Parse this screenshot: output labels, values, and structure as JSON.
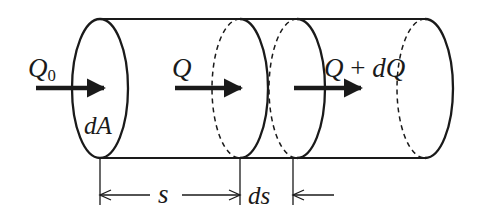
{
  "diagram": {
    "colors": {
      "stroke": "#1a1a1a",
      "background": "#ffffff"
    },
    "labels": {
      "inflow_symbol": "Q",
      "inflow_subscript": "0",
      "area_element": "dA",
      "flow_at_s": "Q",
      "flow_at_s_plus_ds_left": "Q",
      "flow_at_s_plus_ds_op": "+",
      "flow_at_s_plus_ds_right": "dQ",
      "distance": "s",
      "distance_increment": "ds"
    },
    "arrows": [
      {
        "name": "inflow-arrow",
        "label": "Q0",
        "x1": 36,
        "x2": 108,
        "y": 88
      },
      {
        "name": "flow-arrow-s",
        "label": "Q",
        "x1": 175,
        "x2": 245,
        "y": 88
      },
      {
        "name": "flow-arrow-s-plus-ds",
        "label": "Q + dQ",
        "x1": 294,
        "x2": 365,
        "y": 88
      }
    ],
    "dimensions": [
      {
        "name": "s",
        "from_x": 100,
        "to_x": 240,
        "y": 195
      },
      {
        "name": "ds",
        "from_x": 240,
        "to_x": 293,
        "y": 195
      }
    ]
  }
}
